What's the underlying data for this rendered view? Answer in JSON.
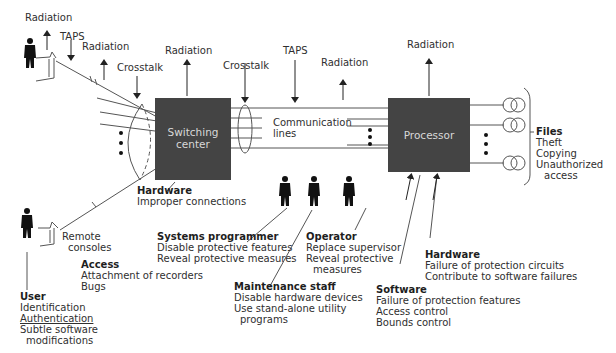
{
  "diagram": {
    "top_labels": {
      "radiation_user": "Radiation",
      "taps_user": "TAPS",
      "radiation_line": "Radiation",
      "crosstalk_left": "Crosstalk",
      "radiation_switch": "Radiation",
      "crosstalk_mid": "Crosstalk",
      "taps_mid": "TAPS",
      "radiation_mid": "Radiation",
      "radiation_processor": "Radiation"
    },
    "switching_center": {
      "line1": "Switching",
      "line2": "center"
    },
    "communication_lines": {
      "line1": "Communication",
      "line2": "lines"
    },
    "processor": {
      "label": "Processor"
    },
    "files": {
      "title": "Files",
      "items": [
        "Theft",
        "Copying",
        "Unauthorized",
        "access"
      ]
    },
    "hardware_switch": {
      "title": "Hardware",
      "items": [
        "Improper connections"
      ]
    },
    "remote_consoles": {
      "line1": "Remote",
      "line2": "consoles"
    },
    "access": {
      "title": "Access",
      "items": [
        "Attachment of recorders",
        "Bugs"
      ]
    },
    "user": {
      "title": "User",
      "items": [
        "Identification",
        "Authentication",
        "Subtle software",
        "modifications"
      ]
    },
    "systems_programmer": {
      "title": "Systems programmer",
      "items": [
        "Disable protective features",
        "Reveal protective measures"
      ]
    },
    "operator": {
      "title": "Operator",
      "items": [
        "Replace supervisor",
        "Reveal protective",
        "measures"
      ]
    },
    "maintenance_staff": {
      "title": "Maintenance staff",
      "items": [
        "Disable hardware devices",
        "Use stand-alone utility",
        "programs"
      ]
    },
    "hardware_processor": {
      "title": "Hardware",
      "items": [
        "Failure of protection circuits",
        "Contribute to software failures"
      ]
    },
    "software": {
      "title": "Software",
      "items": [
        "Failure of protection features",
        "Access control",
        "Bounds control"
      ]
    },
    "colors": {
      "box": "#444444",
      "box_text": "#d8d8d8",
      "line": "#555555"
    }
  }
}
